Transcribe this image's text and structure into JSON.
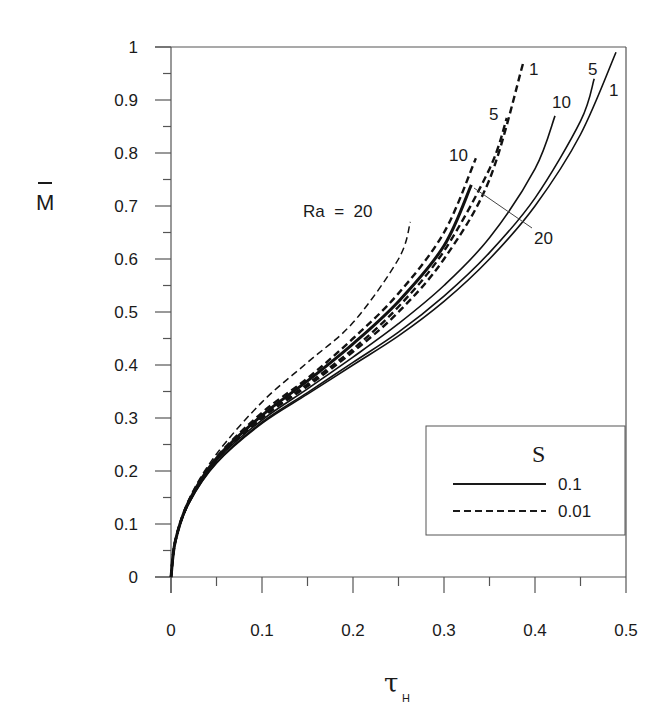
{
  "chart_data": {
    "type": "line",
    "title": "",
    "xlabel": "τ_H",
    "xlabel_main": "τ",
    "xlabel_sub": "H",
    "ylabel": "M̄",
    "xlim": [
      0,
      0.5
    ],
    "ylim": [
      0,
      1
    ],
    "x_ticks": [
      "0",
      "0.1",
      "0.2",
      "0.3",
      "0.4",
      "0.5"
    ],
    "y_ticks": [
      "0",
      "0.1",
      "0.2",
      "0.3",
      "0.4",
      "0.5",
      "0.6",
      "0.7",
      "0.8",
      "0.9",
      "1"
    ],
    "grid": false,
    "legend": {
      "title": "S",
      "position": "lower right",
      "entries": [
        {
          "label": "0.1",
          "style": "solid"
        },
        {
          "label": "0.01",
          "style": "dashed"
        }
      ]
    },
    "series": [
      {
        "name": "S=0.1, Ra=1",
        "style": "solid",
        "width": 1.6,
        "x": [
          0,
          0.005,
          0.02,
          0.05,
          0.1,
          0.15,
          0.2,
          0.25,
          0.3,
          0.35,
          0.4,
          0.45,
          0.489
        ],
        "y": [
          0,
          0.07,
          0.14,
          0.215,
          0.29,
          0.345,
          0.4,
          0.455,
          0.52,
          0.6,
          0.7,
          0.835,
          0.99
        ]
      },
      {
        "name": "S=0.1, Ra=5",
        "style": "solid",
        "width": 1.6,
        "x": [
          0,
          0.005,
          0.02,
          0.05,
          0.1,
          0.15,
          0.2,
          0.25,
          0.3,
          0.35,
          0.4,
          0.45,
          0.465
        ],
        "y": [
          0,
          0.07,
          0.14,
          0.216,
          0.292,
          0.348,
          0.405,
          0.462,
          0.53,
          0.612,
          0.715,
          0.86,
          0.94
        ]
      },
      {
        "name": "S=0.1, Ra=10",
        "style": "solid",
        "width": 1.6,
        "x": [
          0,
          0.005,
          0.02,
          0.05,
          0.1,
          0.15,
          0.2,
          0.25,
          0.3,
          0.35,
          0.4,
          0.422
        ],
        "y": [
          0,
          0.07,
          0.142,
          0.22,
          0.296,
          0.355,
          0.415,
          0.478,
          0.55,
          0.64,
          0.77,
          0.87
        ]
      },
      {
        "name": "S=0.1, Ra=20",
        "style": "solid",
        "width": 3,
        "x": [
          0,
          0.005,
          0.02,
          0.05,
          0.1,
          0.15,
          0.2,
          0.25,
          0.3,
          0.33
        ],
        "y": [
          0,
          0.07,
          0.144,
          0.224,
          0.305,
          0.37,
          0.44,
          0.52,
          0.625,
          0.74
        ]
      },
      {
        "name": "S=0.01, Ra=1",
        "style": "dashed",
        "width": 2.4,
        "x": [
          0,
          0.005,
          0.02,
          0.05,
          0.1,
          0.15,
          0.2,
          0.25,
          0.3,
          0.35,
          0.387
        ],
        "y": [
          0,
          0.07,
          0.142,
          0.221,
          0.3,
          0.36,
          0.425,
          0.5,
          0.6,
          0.75,
          0.97
        ]
      },
      {
        "name": "S=0.01, Ra=5",
        "style": "dashed",
        "width": 2.4,
        "x": [
          0,
          0.005,
          0.02,
          0.05,
          0.1,
          0.15,
          0.2,
          0.25,
          0.3,
          0.35,
          0.369
        ],
        "y": [
          0,
          0.07,
          0.143,
          0.222,
          0.302,
          0.364,
          0.43,
          0.51,
          0.615,
          0.77,
          0.866
        ]
      },
      {
        "name": "S=0.01, Ra=10",
        "style": "dashed",
        "width": 2.4,
        "x": [
          0,
          0.005,
          0.02,
          0.05,
          0.1,
          0.15,
          0.2,
          0.25,
          0.3,
          0.335
        ],
        "y": [
          0,
          0.07,
          0.145,
          0.226,
          0.31,
          0.375,
          0.45,
          0.535,
          0.65,
          0.79
        ]
      },
      {
        "name": "S=0.01, Ra=20",
        "style": "dashed",
        "width": 1.5,
        "x": [
          0,
          0.005,
          0.02,
          0.05,
          0.1,
          0.15,
          0.2,
          0.25,
          0.263
        ],
        "y": [
          0,
          0.07,
          0.148,
          0.232,
          0.33,
          0.405,
          0.48,
          0.6,
          0.67
        ]
      }
    ],
    "annotations": [
      {
        "text": "Ra  =  20",
        "x_px": 303,
        "y_px": 217
      },
      {
        "text": "10",
        "x_px": 449,
        "y_px": 161
      },
      {
        "text": "5",
        "x_px": 489,
        "y_px": 120
      },
      {
        "text": "1",
        "x_px": 529,
        "y_px": 75
      },
      {
        "text": "10",
        "x_px": 552,
        "y_px": 108
      },
      {
        "text": "5",
        "x_px": 588,
        "y_px": 75
      },
      {
        "text": "1",
        "x_px": 609,
        "y_px": 96
      },
      {
        "text": "20",
        "x_px": 534,
        "y_px": 244
      }
    ],
    "leader_line": {
      "from_px": [
        474,
        188
      ],
      "to_px": [
        532,
        228
      ]
    }
  }
}
